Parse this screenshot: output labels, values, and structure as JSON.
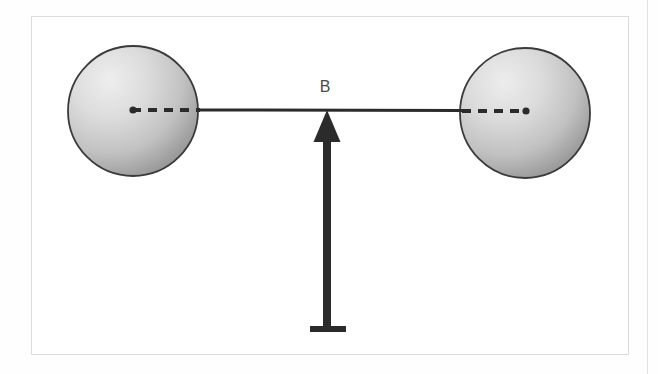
{
  "figure": {
    "kind": "physics-diagram",
    "frame": {
      "visible": true,
      "border_color": "#dcdcdc",
      "background_color": "#ffffff",
      "x": 31,
      "y": 16,
      "width": 598,
      "height": 339
    },
    "margin_rule": {
      "visible": true,
      "color": "#e2e2e2",
      "x": 647
    },
    "labels": [
      {
        "id": "vector-label-B",
        "text": "B",
        "x": 325,
        "y": 90,
        "color": "#4a4a4a",
        "font_size": 16
      }
    ],
    "spheres": [
      {
        "id": "sphere-left",
        "cx": 133,
        "cy": 111,
        "r": 65,
        "outline_color": "#3a3a3a",
        "highlight_color": "#e6e6e6",
        "shadow_color": "#8c8c8c"
      },
      {
        "id": "sphere-right",
        "cx": 525,
        "cy": 113,
        "r": 65,
        "outline_color": "#3a3a3a",
        "highlight_color": "#e6e6e6",
        "shadow_color": "#8c8c8c"
      }
    ],
    "axis_line": {
      "id": "connecting-axis",
      "y": 110,
      "solid_from": 198,
      "solid_to": 462,
      "color": "#2b2b2b",
      "stroke_width": 3
    },
    "dashed_segments": [
      {
        "id": "dash-left",
        "x_from": 132,
        "x_to": 200,
        "y": 110,
        "color": "#2b2b2b",
        "pattern": "9 7"
      },
      {
        "id": "dash-right",
        "x_from": 460,
        "x_to": 527,
        "y": 111,
        "color": "#2b2b2b",
        "pattern": "9 7"
      }
    ],
    "center_dots": [
      {
        "id": "center-dot-left",
        "cx": 133,
        "cy": 110,
        "r": 3.5,
        "color": "#2b2b2b"
      },
      {
        "id": "center-dot-right",
        "cx": 526,
        "cy": 111,
        "r": 3.5,
        "color": "#2b2b2b"
      }
    ],
    "arrow": {
      "id": "force-vector-B",
      "direction": "up",
      "tip_x": 327,
      "tip_y": 110,
      "tail_y": 330,
      "shaft_width": 8,
      "head_width": 27,
      "head_height": 32,
      "base_bar": {
        "x_from": 310,
        "x_to": 346,
        "y": 327,
        "height": 6
      },
      "color": "#2b2b2b"
    }
  }
}
